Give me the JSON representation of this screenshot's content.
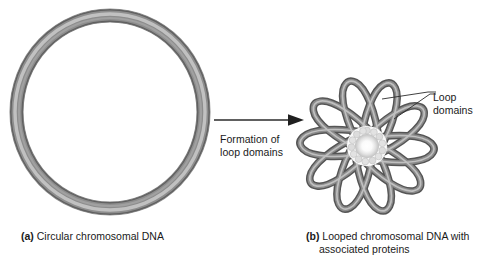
{
  "figure": {
    "background_color": "#ffffff"
  },
  "panel_a": {
    "id": "a",
    "tag": "(a)",
    "caption": "Circular chromosomal DNA",
    "structure": "circular-dna-ring",
    "shape": "torus",
    "tube_color_dark": "#6e6e6e",
    "tube_color_mid": "#9a9a9a",
    "tube_color_light": "#c9c9c9",
    "center_x": 110,
    "center_y": 112,
    "radius": 92,
    "tube_thickness": 11
  },
  "transition": {
    "arrow_label_line1": "Formation of",
    "arrow_label_line2": "loop domains",
    "arrow_direction": "right",
    "arrow_color": "#2b2b2b"
  },
  "panel_b": {
    "id": "b",
    "tag": "(b)",
    "caption_line1": "Looped chromosomal DNA with",
    "caption_line2": "associated proteins",
    "structure": "rosette-loop-domains",
    "loop_count": 10,
    "tube_color_dark": "#5e5e5e",
    "tube_color_mid": "#8f8f8f",
    "tube_color_light": "#cfcfcf",
    "core_label": "associated proteins",
    "core_color": "#ffffff",
    "core_bead_color": "#d7d7d7",
    "core_bead_count": 14,
    "center_x": 82,
    "center_y": 84,
    "loop_length": 66,
    "loop_width": 21
  },
  "callout": {
    "label_line1": "Loop",
    "label_line2": "domains",
    "leader_line_count": 2,
    "leader_color": "#2b2b2b"
  }
}
